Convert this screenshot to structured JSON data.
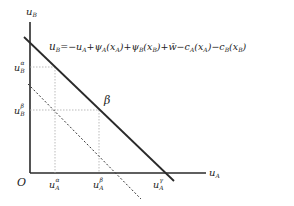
{
  "diagram": {
    "axes": {
      "y_label": "u",
      "y_label_sub": "B",
      "x_label": "u",
      "x_label_sub": "A",
      "origin": "O"
    },
    "equation": {
      "lhs": "u",
      "lhs_sub": "B",
      "rhs": "= −u_A + ψ_A(x_A) + ψ_B(x_B) + w̄ − c_A(x_A) − c_B(x_B)"
    },
    "curve_label": "β",
    "y_ticks": [
      {
        "base": "u",
        "sub": "B",
        "sup": "α"
      },
      {
        "base": "u",
        "sub": "B",
        "sup": "β"
      }
    ],
    "x_ticks": [
      {
        "base": "u",
        "sub": "A",
        "sup": "α"
      },
      {
        "base": "u",
        "sub": "A",
        "sup": "β"
      },
      {
        "base": "u",
        "sub": "A",
        "sup": "γ"
      }
    ],
    "lines": {
      "solid": "budget frontier β",
      "dashed": "lower frontier"
    }
  }
}
